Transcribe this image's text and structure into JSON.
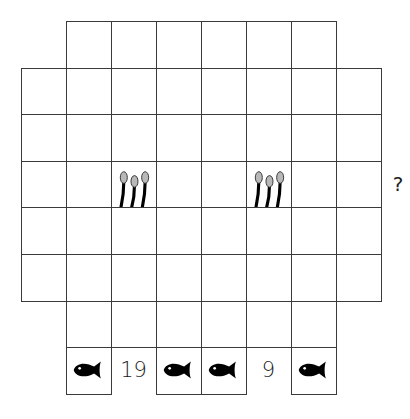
{
  "puzzle": {
    "grid": {
      "cell_width": 45,
      "cell_height": 46.6,
      "origin_x": 21,
      "origin_y": 21,
      "rows": [
        {
          "row": 0,
          "cols": [
            1,
            2,
            3,
            4,
            5,
            6
          ]
        },
        {
          "row": 1,
          "cols": [
            0,
            1,
            2,
            3,
            4,
            5,
            6,
            7
          ]
        },
        {
          "row": 2,
          "cols": [
            0,
            1,
            2,
            3,
            4,
            5,
            6,
            7
          ]
        },
        {
          "row": 3,
          "cols": [
            0,
            1,
            2,
            3,
            4,
            5,
            6,
            7
          ]
        },
        {
          "row": 4,
          "cols": [
            0,
            1,
            2,
            3,
            4,
            5,
            6,
            7
          ]
        },
        {
          "row": 5,
          "cols": [
            0,
            1,
            2,
            3,
            4,
            5,
            6,
            7
          ]
        },
        {
          "row": 6,
          "cols": [
            1,
            2,
            3,
            4,
            5,
            6
          ]
        }
      ]
    },
    "pieces": [
      {
        "row": 3,
        "col": 2,
        "icon": "cattails-icon"
      },
      {
        "row": 3,
        "col": 5,
        "icon": "cattails-icon"
      }
    ],
    "bottom_clues": [
      {
        "col": 1,
        "type": "icon",
        "icon": "fish-icon"
      },
      {
        "col": 2,
        "type": "text",
        "text": "19"
      },
      {
        "col": 3,
        "type": "icon",
        "icon": "fish-icon"
      },
      {
        "col": 4,
        "type": "icon",
        "icon": "fish-icon"
      },
      {
        "col": 5,
        "type": "text",
        "text": "9"
      },
      {
        "col": 6,
        "type": "icon",
        "icon": "fish-icon"
      }
    ],
    "side_clue": {
      "row": 3,
      "text": "?"
    },
    "colors": {
      "grid_line": "#3a3a3a",
      "icon_black": "#000000",
      "cattail_head": "#b8b8b8"
    }
  }
}
